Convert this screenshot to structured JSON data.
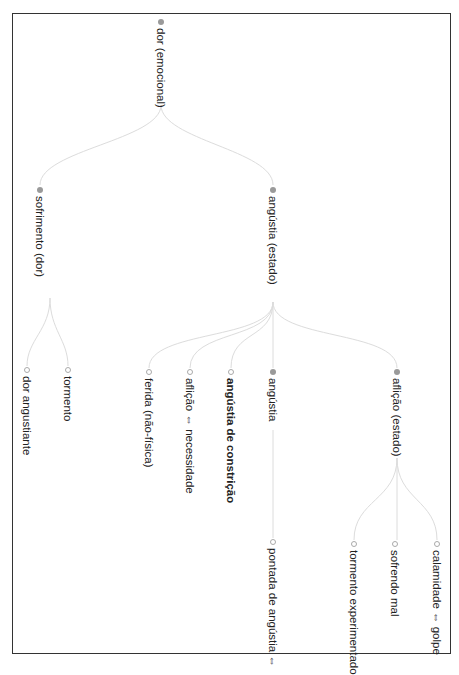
{
  "header": {
    "clipped_text": "... CONSTRUINDO O CONHECIMENTO AGENCIADO ..."
  },
  "tree": {
    "root": {
      "label": "dor (emocional)",
      "type": "filled"
    },
    "level1": [
      {
        "label": "sofrimento (dor)",
        "type": "filled"
      },
      {
        "label": "angústia (estado)",
        "type": "filled"
      }
    ],
    "level2": [
      {
        "label": "dor angustiante",
        "type": "hollow",
        "parent": "sofrimento (dor)"
      },
      {
        "label": "tormento",
        "type": "hollow",
        "parent": "sofrimento (dor)"
      },
      {
        "label": "ferida (não-física)",
        "type": "hollow",
        "parent": "angústia (estado)"
      },
      {
        "label": "aflição ⇔ necessidade",
        "type": "hollow",
        "parent": "angústia (estado)"
      },
      {
        "label": "angústia de constrição",
        "type": "hollow",
        "bold": true,
        "parent": "angústia (estado)"
      },
      {
        "label": "angústia",
        "type": "filled",
        "parent": "angústia (estado)"
      },
      {
        "label": "aflição (estado)",
        "type": "filled",
        "parent": "angústia (estado)"
      }
    ],
    "level3": [
      {
        "label": "pontada de angústia ⇔",
        "type": "hollow",
        "parent": "angústia"
      },
      {
        "label": "tormento experimentado",
        "type": "hollow",
        "parent": "aflição (estado)"
      },
      {
        "label": "sofrendo mal",
        "type": "hollow",
        "parent": "aflição (estado)"
      },
      {
        "label": "calamidade ⇔ golpe",
        "type": "hollow",
        "parent": "aflição (estado)"
      }
    ]
  },
  "colors": {
    "edge": "#dcdcdc",
    "frame": "#333333",
    "filled_dot": "#9a9a9a",
    "text": "#222222"
  }
}
